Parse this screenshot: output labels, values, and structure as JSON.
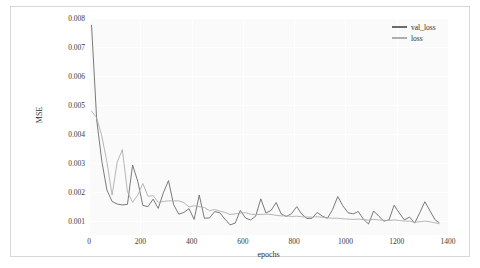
{
  "chart_data": {
    "type": "line",
    "title": "",
    "xlabel": "epochs",
    "ylabel": "MSE",
    "xlim": [
      0,
      1400
    ],
    "ylim": [
      0.0005,
      0.008
    ],
    "grid": true,
    "legend_position": "top-right",
    "xticks": [
      0,
      200,
      400,
      600,
      800,
      1000,
      1200,
      1400
    ],
    "xtick_labels": [
      "0",
      "200",
      "400",
      "600",
      "800",
      "1000",
      "1200",
      "1400"
    ],
    "yticks": [
      0.001,
      0.002,
      0.003,
      0.004,
      0.005,
      0.006,
      0.007,
      0.008
    ],
    "ytick_labels": [
      "0.001",
      "0.002",
      "0.003",
      "0.004",
      "0.005",
      "0.006",
      "0.007",
      "0.008"
    ],
    "series": [
      {
        "name": "val_loss",
        "color": "#6b6b6b",
        "x": [
          10,
          30,
          50,
          70,
          90,
          110,
          130,
          150,
          170,
          190,
          210,
          230,
          250,
          270,
          290,
          310,
          330,
          350,
          370,
          390,
          410,
          430,
          450,
          470,
          490,
          510,
          530,
          550,
          570,
          590,
          610,
          630,
          650,
          670,
          690,
          710,
          730,
          750,
          770,
          790,
          810,
          830,
          850,
          870,
          890,
          910,
          930,
          950,
          970,
          990,
          1010,
          1030,
          1050,
          1070,
          1090,
          1110,
          1130,
          1150,
          1170,
          1190,
          1210,
          1230,
          1250,
          1270,
          1290,
          1310,
          1330,
          1350,
          1365
        ],
        "values": [
          0.00775,
          0.00448,
          0.00305,
          0.00205,
          0.00166,
          0.00157,
          0.00154,
          0.00156,
          0.00292,
          0.00236,
          0.00152,
          0.00148,
          0.00174,
          0.00142,
          0.00196,
          0.00238,
          0.00155,
          0.00122,
          0.00128,
          0.00141,
          0.00104,
          0.00188,
          0.00108,
          0.00109,
          0.00131,
          0.00127,
          0.00105,
          0.00085,
          0.00091,
          0.00135,
          0.00109,
          0.00102,
          0.00115,
          0.00175,
          0.00126,
          0.00135,
          0.00162,
          0.00122,
          0.00114,
          0.00124,
          0.00148,
          0.00122,
          0.00107,
          0.00108,
          0.00128,
          0.00115,
          0.00108,
          0.00138,
          0.00183,
          0.00151,
          0.00127,
          0.00123,
          0.00131,
          0.00105,
          0.00088,
          0.00133,
          0.00115,
          0.00098,
          0.00102,
          0.00153,
          0.00126,
          0.00102,
          0.00112,
          0.00091,
          0.00127,
          0.00165,
          0.00133,
          0.00102,
          0.00093
        ]
      },
      {
        "name": "loss",
        "color": "#aeaeae",
        "x": [
          10,
          30,
          50,
          70,
          90,
          110,
          130,
          150,
          170,
          190,
          210,
          230,
          250,
          270,
          290,
          310,
          330,
          350,
          370,
          390,
          410,
          430,
          450,
          470,
          490,
          510,
          530,
          550,
          570,
          590,
          610,
          630,
          650,
          670,
          690,
          710,
          730,
          750,
          770,
          790,
          810,
          830,
          850,
          870,
          890,
          910,
          930,
          950,
          970,
          990,
          1010,
          1030,
          1050,
          1070,
          1090,
          1110,
          1130,
          1150,
          1170,
          1190,
          1210,
          1230,
          1250,
          1270,
          1290,
          1310,
          1330,
          1350,
          1365
        ],
        "values": [
          0.00478,
          0.00455,
          0.00392,
          0.00302,
          0.00188,
          0.00302,
          0.00345,
          0.00199,
          0.00163,
          0.00188,
          0.00228,
          0.00184,
          0.00186,
          0.00163,
          0.00166,
          0.00168,
          0.00168,
          0.00168,
          0.00162,
          0.00147,
          0.00151,
          0.00148,
          0.00145,
          0.00134,
          0.00138,
          0.00133,
          0.00128,
          0.00121,
          0.00123,
          0.00126,
          0.00127,
          0.00122,
          0.00121,
          0.00121,
          0.00122,
          0.00121,
          0.00118,
          0.00116,
          0.00116,
          0.00114,
          0.00115,
          0.00113,
          0.00112,
          0.00112,
          0.00113,
          0.00111,
          0.00109,
          0.00108,
          0.00108,
          0.00106,
          0.00105,
          0.00104,
          0.00105,
          0.00103,
          0.00102,
          0.00104,
          0.00102,
          0.00101,
          0.001,
          0.00102,
          0.001,
          0.00098,
          0.00098,
          0.00094,
          0.00096,
          0.00098,
          0.00096,
          0.00092,
          0.00089
        ]
      }
    ]
  },
  "legend": {
    "entries": [
      {
        "label": "val_loss"
      },
      {
        "label": "loss"
      }
    ]
  }
}
